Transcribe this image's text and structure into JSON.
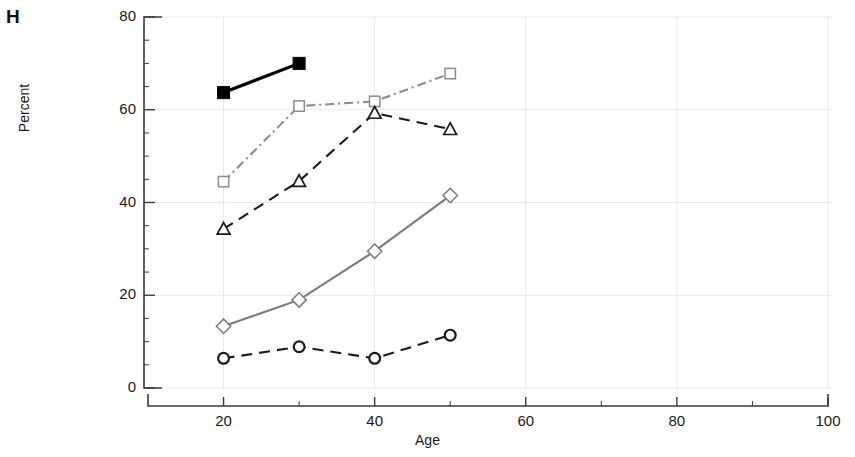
{
  "panel": {
    "label": "H"
  },
  "chart_data": {
    "type": "line",
    "title": "",
    "subtitle": "",
    "xlabel": "Age",
    "ylabel": "Percent",
    "xlim": [
      10,
      100
    ],
    "ylim": [
      0,
      80
    ],
    "xticks": [
      20,
      40,
      60,
      80,
      100
    ],
    "xtick_labels": [
      "20",
      "40",
      "60",
      "80",
      "100"
    ],
    "xminor_ticks": [
      30,
      50,
      70,
      90
    ],
    "yticks": [
      0,
      20,
      40,
      60,
      80
    ],
    "ytick_labels": [
      "0",
      "20",
      "40",
      "60",
      "80"
    ],
    "grid": true,
    "grid_color": "#e8e8e8",
    "legend": "none",
    "axis_color": "#3a3a3a",
    "series": [
      {
        "name": "filled-square-solid",
        "marker": "filled-square",
        "linestyle": "solid",
        "color": "#000000",
        "x": [
          20,
          30
        ],
        "values": [
          63.7,
          70.0
        ]
      },
      {
        "name": "open-square-dashdot",
        "marker": "open-square",
        "linestyle": "dashdot",
        "color": "#8c8c8c",
        "x": [
          20,
          30,
          40,
          50
        ],
        "values": [
          44.5,
          60.8,
          61.8,
          67.8
        ]
      },
      {
        "name": "open-triangle-dashed",
        "marker": "open-triangle",
        "linestyle": "dashed",
        "color": "#1a1a1a",
        "x": [
          20,
          30,
          40,
          50
        ],
        "values": [
          34.3,
          44.6,
          59.3,
          55.8
        ]
      },
      {
        "name": "open-diamond-solid",
        "marker": "open-diamond",
        "linestyle": "solid",
        "color": "#7a7a7a",
        "x": [
          20,
          30,
          40,
          50
        ],
        "values": [
          13.3,
          19.0,
          29.5,
          41.5
        ]
      },
      {
        "name": "open-circle-dashed",
        "marker": "open-circle",
        "linestyle": "dashed",
        "color": "#1a1a1a",
        "x": [
          20,
          30,
          40,
          50
        ],
        "values": [
          6.4,
          8.9,
          6.4,
          11.4
        ]
      }
    ]
  }
}
